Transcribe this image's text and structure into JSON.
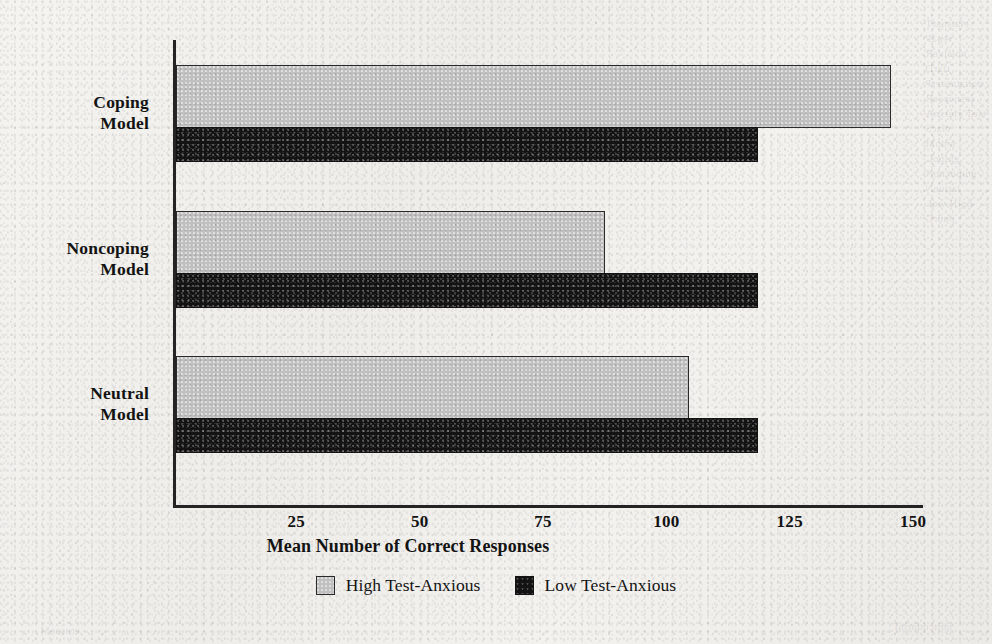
{
  "chart_data": {
    "type": "bar",
    "orientation": "horizontal",
    "title": "",
    "xlabel": "Mean Number of Correct Responses",
    "ylabel": "",
    "categories": [
      "Coping Model",
      "Noncoping Model",
      "Neutral Model"
    ],
    "series": [
      {
        "name": "High Test-Anxious",
        "color": "#c0c0c0",
        "values": [
          145,
          87,
          104
        ]
      },
      {
        "name": "Low Test-Anxious",
        "color": "#131313",
        "values": [
          118,
          118,
          118
        ]
      }
    ],
    "xlim": [
      0,
      152
    ],
    "xticks": [
      25,
      50,
      75,
      100,
      125,
      150
    ],
    "xtick_labels": [
      "25",
      "50",
      "75",
      "100",
      "125",
      "150"
    ],
    "grid": false,
    "legend_position": "bottom-center"
  },
  "axis": {
    "x_title": "Mean Number of Correct Responses",
    "ticks": [
      {
        "label": "25",
        "value": 25
      },
      {
        "label": "50",
        "value": 50
      },
      {
        "label": "75",
        "value": 75
      },
      {
        "label": "100",
        "value": 100
      },
      {
        "label": "125",
        "value": 125
      },
      {
        "label": "150",
        "value": 150
      }
    ]
  },
  "categories": [
    {
      "line1": "Coping",
      "line2": "Model"
    },
    {
      "line1": "Noncoping",
      "line2": "Model"
    },
    {
      "line1": "Neutral",
      "line2": "Model"
    }
  ],
  "legend": {
    "items": [
      {
        "label": "High Test-Anxious",
        "swatch": "high"
      },
      {
        "label": "Low Test-Anxious",
        "swatch": "low"
      }
    ]
  },
  "colors": {
    "high_test_anxious": "#c0c0c0",
    "low_test_anxious": "#131313",
    "axis": "#242424",
    "page_background": "#f2f1ee",
    "text": "#131313"
  },
  "bleed_through": {
    "right_column": "elatsnarT\nrepaP\nnoisiveR\ntfarD\nnoitatneserP\nsesnopseR\ntseT yteixnA\nelacS\nledoM\ngnipoC\ngnipocnoN\nlartueN\nhgiH woL\npuorG",
    "bottom_left": "erusaeM",
    "bottom_right": "noitcudortnI"
  }
}
